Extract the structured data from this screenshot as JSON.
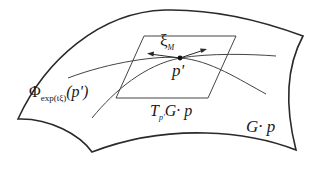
{
  "diagram": {
    "labels": {
      "xi": "ξ",
      "xi_sub": "M",
      "point": "p'",
      "phi": "Φ",
      "phi_sub": "exp(tξ)",
      "phi_arg": "(p')",
      "tangent_T": "T",
      "tangent_sub": "p'",
      "tangent_rest": "G· p",
      "orbit": "G· p"
    },
    "colors": {
      "stroke": "#2a2a2a",
      "thin_stroke": "#444444",
      "background": "#ffffff"
    }
  }
}
